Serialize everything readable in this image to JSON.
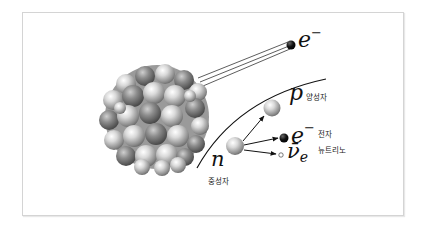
{
  "diagram": {
    "type": "beta-decay",
    "nucleus": {
      "label": "",
      "description": "atomic nucleus (cluster of nucleons)"
    },
    "emitted_electron": {
      "symbol": "e",
      "superscript": "−"
    },
    "neutron": {
      "symbol": "n",
      "label": "중성자"
    },
    "products": [
      {
        "id": "proton",
        "symbol": "p",
        "sup": "",
        "sub": "",
        "label": "양성자"
      },
      {
        "id": "electron",
        "symbol": "e",
        "sup": "−",
        "sub": "",
        "label": "전자"
      },
      {
        "id": "antineutrino",
        "symbol": "ν̄",
        "sup": "",
        "sub": "e",
        "label": "뉴트리노"
      }
    ]
  },
  "colors": {
    "frame_border": "#d4d4d4",
    "nucleon_light": "#f2f2f2",
    "nucleon_dark": "#6a6a6a",
    "electron": "#111111",
    "lines": "#222222"
  }
}
